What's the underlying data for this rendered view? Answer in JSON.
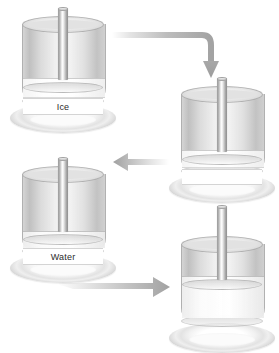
{
  "figure": {
    "type": "process-diagram",
    "background_color": "#ffffff",
    "accent_color": "#9a9a9a",
    "glass_color": "#c8c8c8",
    "rod_color": "#b0b0b0",
    "label_text_color": "#2b2b2b"
  },
  "stages": [
    {
      "id": "stage-1",
      "order": 1,
      "label": "Ice",
      "state": "solid",
      "content_fill_percent": 0,
      "solid_band_percent": 22,
      "x": 8,
      "y": 8
    },
    {
      "id": "stage-2",
      "order": 2,
      "label": "",
      "state": "melting",
      "content_fill_percent": 0,
      "solid_band_percent": 20,
      "x": 167,
      "y": 78
    },
    {
      "id": "stage-3",
      "order": 3,
      "label": "Water",
      "state": "melted",
      "content_fill_percent": 0,
      "solid_band_percent": 20,
      "x": 8,
      "y": 158
    },
    {
      "id": "stage-4",
      "order": 4,
      "label": "",
      "state": "liquid",
      "content_fill_percent": 55,
      "solid_band_percent": 0,
      "x": 167,
      "y": 228
    }
  ],
  "arrows": [
    {
      "id": "arrow-1",
      "direction": "right-then-down",
      "from_stage": "stage-1",
      "to_stage": "stage-2"
    },
    {
      "id": "arrow-2",
      "direction": "left",
      "from_stage": "stage-2",
      "to_stage": "stage-3"
    },
    {
      "id": "arrow-3",
      "direction": "right",
      "from_stage": "stage-3",
      "to_stage": "stage-4"
    }
  ]
}
